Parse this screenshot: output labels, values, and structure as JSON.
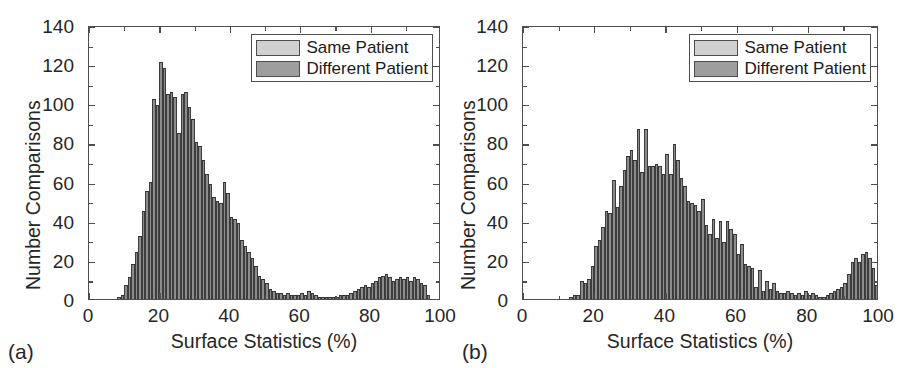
{
  "figure": {
    "background": "#ffffff",
    "bar_color": "#8c8c8c",
    "bar_edge_color": "#333333",
    "axis_color": "#4d4d4d",
    "text_color": "#262626"
  },
  "panels": [
    {
      "id": "a",
      "subplot_label": "(a)",
      "legend": {
        "items": [
          {
            "label": "Same Patient",
            "color": "#d0d0d0"
          },
          {
            "label": "Different Patient",
            "color": "#9e9e9e"
          }
        ]
      }
    },
    {
      "id": "b",
      "subplot_label": "(b)",
      "legend": {
        "items": [
          {
            "label": "Same Patient",
            "color": "#d0d0d0"
          },
          {
            "label": "Different Patient",
            "color": "#9e9e9e"
          }
        ]
      }
    }
  ],
  "chart_data": [
    {
      "type": "bar",
      "panel": "a",
      "title": "",
      "xlabel": "Surface Statistics (%)",
      "ylabel": "Number Comparisons",
      "xlim": [
        0,
        100
      ],
      "ylim": [
        0,
        140
      ],
      "xticks": [
        0,
        20,
        40,
        60,
        80,
        100
      ],
      "yticks": [
        0,
        20,
        40,
        60,
        80,
        100,
        120,
        140
      ],
      "xtick_labels": [
        "0",
        "20",
        "40",
        "60",
        "80",
        "100"
      ],
      "ytick_labels": [
        "0",
        "20",
        "40",
        "60",
        "80",
        "100",
        "120",
        "140"
      ],
      "grid": false,
      "legend_position": "upper right",
      "bin_width": 1,
      "series": [
        {
          "name": "Different Patient",
          "color": "#8c8c8c",
          "x": [
            8,
            9,
            10,
            11,
            12,
            13,
            14,
            15,
            16,
            17,
            18,
            19,
            20,
            21,
            22,
            23,
            24,
            25,
            26,
            27,
            28,
            29,
            30,
            31,
            32,
            33,
            34,
            35,
            36,
            37,
            38,
            39,
            40,
            41,
            42,
            43,
            44,
            45,
            46,
            47,
            48,
            49,
            50,
            51,
            52,
            53,
            54,
            55,
            56,
            57,
            58,
            59,
            60,
            61,
            62,
            63,
            64,
            65,
            66,
            67,
            68,
            69,
            70,
            71,
            72,
            73,
            74,
            75,
            76,
            77,
            78,
            79,
            80,
            81,
            82,
            83,
            84,
            85,
            86,
            87,
            88,
            89,
            90,
            91,
            92,
            93,
            94,
            95,
            96
          ],
          "values": [
            1,
            2,
            7,
            11,
            18,
            24,
            32,
            45,
            55,
            60,
            102,
            99,
            121,
            118,
            105,
            106,
            103,
            85,
            105,
            106,
            98,
            92,
            80,
            78,
            71,
            64,
            59,
            52,
            50,
            49,
            60,
            54,
            42,
            41,
            39,
            30,
            27,
            24,
            21,
            17,
            12,
            10,
            8,
            5,
            4,
            3,
            3,
            2,
            3,
            2,
            2,
            2,
            3,
            2,
            4,
            3,
            2,
            1,
            1,
            1,
            1,
            1,
            1,
            2,
            2,
            2,
            3,
            4,
            5,
            6,
            7,
            6,
            8,
            9,
            11,
            12,
            13,
            11,
            9,
            10,
            11,
            10,
            11,
            9,
            11,
            10,
            8,
            7,
            2
          ]
        }
      ]
    },
    {
      "type": "bar",
      "panel": "b",
      "title": "",
      "xlabel": "Surface Statistics (%)",
      "ylabel": "Number Comparisons",
      "xlim": [
        0,
        100
      ],
      "ylim": [
        0,
        140
      ],
      "xticks": [
        0,
        20,
        40,
        60,
        80,
        100
      ],
      "yticks": [
        0,
        20,
        40,
        60,
        80,
        100,
        120,
        140
      ],
      "xtick_labels": [
        "0",
        "20",
        "40",
        "60",
        "80",
        "100"
      ],
      "ytick_labels": [
        "0",
        "20",
        "40",
        "60",
        "80",
        "100",
        "120",
        "140"
      ],
      "grid": false,
      "legend_position": "upper right",
      "bin_width": 1,
      "series": [
        {
          "name": "Different Patient",
          "color": "#8c8c8c",
          "x": [
            13,
            14,
            15,
            16,
            17,
            18,
            19,
            20,
            21,
            22,
            23,
            24,
            25,
            26,
            27,
            28,
            29,
            30,
            31,
            32,
            33,
            34,
            35,
            36,
            37,
            38,
            39,
            40,
            41,
            42,
            43,
            44,
            45,
            46,
            47,
            48,
            49,
            50,
            51,
            52,
            53,
            54,
            55,
            56,
            57,
            58,
            59,
            60,
            61,
            62,
            63,
            64,
            65,
            66,
            67,
            68,
            69,
            70,
            71,
            72,
            73,
            74,
            75,
            76,
            77,
            78,
            79,
            80,
            81,
            82,
            83,
            84,
            85,
            86,
            87,
            88,
            89,
            90,
            91,
            92,
            93,
            94,
            95,
            96,
            97,
            98,
            99
          ],
          "values": [
            1,
            2,
            2,
            9,
            8,
            10,
            17,
            27,
            30,
            37,
            45,
            44,
            61,
            47,
            58,
            66,
            73,
            76,
            71,
            87,
            65,
            87,
            68,
            68,
            69,
            68,
            64,
            74,
            64,
            79,
            71,
            62,
            58,
            50,
            49,
            48,
            45,
            51,
            38,
            33,
            41,
            31,
            40,
            29,
            40,
            36,
            33,
            23,
            28,
            18,
            17,
            16,
            6,
            15,
            4,
            9,
            5,
            8,
            4,
            3,
            3,
            4,
            3,
            2,
            3,
            2,
            4,
            2,
            3,
            2,
            1,
            1,
            2,
            3,
            4,
            5,
            6,
            8,
            13,
            19,
            21,
            19,
            23,
            24,
            21,
            16,
            7
          ]
        }
      ]
    }
  ]
}
